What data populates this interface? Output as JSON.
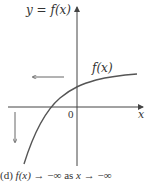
{
  "figure": {
    "y_axis_label": "y = f(x)",
    "x_axis_label": "x",
    "origin_label": "0",
    "curve_label": "f(x)",
    "caption": {
      "part": "(d)",
      "f": "f(x)",
      "arrow1": "→",
      "limit": "−∞",
      "as": "as",
      "x": "x",
      "arrow2": "→",
      "limit2": "−∞"
    },
    "colors": {
      "axis": "#444444",
      "curve": "#555555",
      "arrows": "#555555",
      "text": "#333333"
    }
  }
}
